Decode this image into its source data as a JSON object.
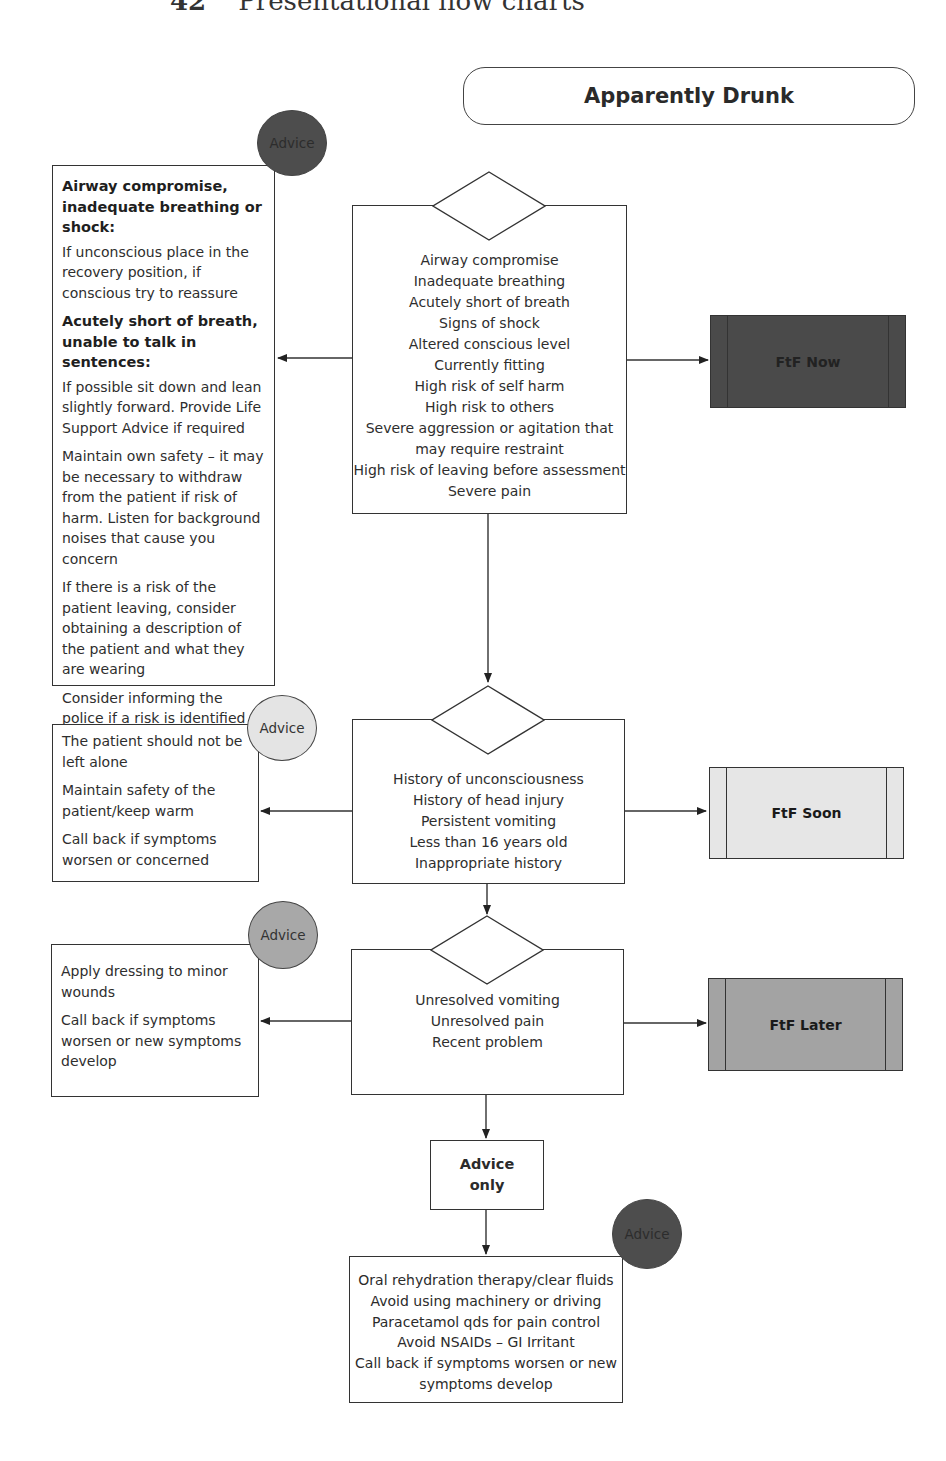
{
  "page_header": {
    "number": "42",
    "title": "Presentational flow charts"
  },
  "title": "Apparently Drunk",
  "colors": {
    "ftf_now": "#4a4a4a",
    "ftf_soon": "#e6e6e6",
    "ftf_later": "#a3a3a3",
    "advice_red": "#4d4d4d",
    "advice_amber": "#e4e4e4",
    "advice_green": "#a8a8a8"
  },
  "levels": [
    {
      "id": "red",
      "criteria": [
        "Airway compromise",
        "Inadequate breathing",
        "Acutely short of breath",
        "Signs of shock",
        "Altered conscious level",
        "Currently fitting",
        "High risk of self harm",
        "High risk to others",
        "Severe aggression or agitation that",
        "may require restraint",
        "High risk of leaving before assessment",
        "Severe pain"
      ],
      "disposition": "FtF Now",
      "advice_badge": "Advice",
      "advice": [
        {
          "heading": "Airway compromise, inadequate breathing or shock:",
          "text": "If unconscious place in the recovery position, if conscious try to reassure"
        },
        {
          "heading": "Acutely short of breath, unable to talk in sentences:",
          "text": "If possible sit down and lean slightly forward. Provide Life Support Advice if required"
        },
        {
          "heading": "",
          "text": "Maintain own safety – it may be necessary to withdraw from the patient if risk of harm. Listen for background noises that cause you concern"
        },
        {
          "heading": "",
          "text": "If there is a risk of the patient leaving, consider obtaining a description of the patient and what they are wearing"
        },
        {
          "heading": "",
          "text": "Consider informing the police if a risk is identified"
        }
      ]
    },
    {
      "id": "amber",
      "criteria": [
        "History of unconsciousness",
        "History of head injury",
        "Persistent vomiting",
        "Less than 16 years old",
        "Inappropriate history"
      ],
      "disposition": "FtF Soon",
      "advice_badge": "Advice",
      "advice": [
        {
          "heading": "",
          "text": "The patient should not be left alone"
        },
        {
          "heading": "",
          "text": "Maintain safety of the patient/keep warm"
        },
        {
          "heading": "",
          "text": "Call back if symptoms worsen or concerned"
        }
      ]
    },
    {
      "id": "green",
      "criteria": [
        "Unresolved vomiting",
        "Unresolved pain",
        "Recent problem"
      ],
      "disposition": "FtF Later",
      "advice_badge": "Advice",
      "advice": [
        {
          "heading": "",
          "text": "Apply dressing to minor wounds"
        },
        {
          "heading": "",
          "text": "Call back if symptoms worsen or new symptoms develop"
        }
      ]
    }
  ],
  "advice_only": {
    "label_line1": "Advice",
    "label_line2": "only",
    "advice_badge": "Advice",
    "items": [
      "Oral rehydration therapy/clear fluids",
      "Avoid using machinery or driving",
      "Paracetamol qds for pain control",
      "Avoid NSAIDs – GI Irritant",
      "Call back if symptoms worsen or new",
      "symptoms develop"
    ]
  }
}
